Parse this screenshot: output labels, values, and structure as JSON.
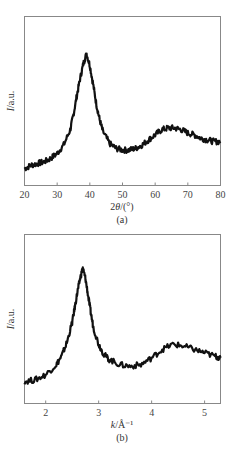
{
  "chart_data": [
    {
      "type": "line",
      "panel_label": "(a)",
      "xlabel_prefix": "2",
      "xlabel_italic": "θ",
      "xlabel_suffix": "/(°)",
      "ylabel_italic": "I",
      "ylabel_suffix": "/a.u.",
      "xlim": [
        20,
        80
      ],
      "xticks": [
        20,
        30,
        40,
        50,
        60,
        70,
        80
      ],
      "ylim": [
        0,
        1
      ],
      "yticks": [],
      "grid": false,
      "legend": null,
      "description": "X-ray diffraction pattern: broad amorphous peak near 2θ≈39°, second broad hump near 65°",
      "x": [
        20,
        22,
        24,
        26,
        28,
        30,
        32,
        34,
        35,
        36,
        37,
        38,
        39,
        40,
        41,
        42,
        43,
        44,
        46,
        48,
        50,
        52,
        54,
        56,
        58,
        60,
        62,
        64,
        66,
        68,
        70,
        72,
        74,
        76,
        78,
        80
      ],
      "values": [
        0.1,
        0.12,
        0.13,
        0.14,
        0.16,
        0.19,
        0.24,
        0.33,
        0.42,
        0.53,
        0.63,
        0.72,
        0.78,
        0.71,
        0.6,
        0.48,
        0.39,
        0.32,
        0.25,
        0.22,
        0.21,
        0.21,
        0.22,
        0.24,
        0.27,
        0.3,
        0.33,
        0.34,
        0.34,
        0.33,
        0.31,
        0.3,
        0.28,
        0.27,
        0.26,
        0.26
      ]
    },
    {
      "type": "line",
      "panel_label": "(b)",
      "xlabel_italic": "k",
      "xlabel_suffix": "/Å⁻¹",
      "ylabel_italic": "I",
      "ylabel_suffix": "/a.u.",
      "xlim": [
        1.6,
        5.3
      ],
      "xticks": [
        2,
        3,
        4,
        5
      ],
      "ylim": [
        0,
        1
      ],
      "yticks": [],
      "grid": false,
      "legend": null,
      "description": "Same data plotted versus scattering vector k: main peak near k≈2.7 Å⁻¹, second hump near 4.4 Å⁻¹",
      "x": [
        1.6,
        1.8,
        2.0,
        2.2,
        2.3,
        2.4,
        2.5,
        2.55,
        2.6,
        2.65,
        2.7,
        2.75,
        2.8,
        2.85,
        2.9,
        3.0,
        3.1,
        3.2,
        3.4,
        3.6,
        3.8,
        4.0,
        4.2,
        4.4,
        4.6,
        4.8,
        5.0,
        5.2,
        5.3
      ],
      "values": [
        0.13,
        0.14,
        0.17,
        0.23,
        0.28,
        0.36,
        0.48,
        0.57,
        0.66,
        0.74,
        0.8,
        0.74,
        0.64,
        0.54,
        0.45,
        0.35,
        0.29,
        0.26,
        0.23,
        0.22,
        0.23,
        0.27,
        0.32,
        0.35,
        0.34,
        0.32,
        0.3,
        0.28,
        0.27
      ]
    }
  ]
}
